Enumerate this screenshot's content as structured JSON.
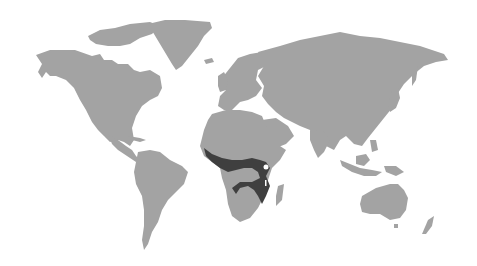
{
  "map": {
    "type": "world-map",
    "background_color": "#ffffff",
    "land_color": "#a3a3a3",
    "highlight_color": "#3f3f3f",
    "marker_color": "#ffffff",
    "highlighted_region": "central-africa-band",
    "markers": [
      {
        "name": "lake-victoria-marker",
        "x": 266,
        "y": 168
      }
    ]
  }
}
